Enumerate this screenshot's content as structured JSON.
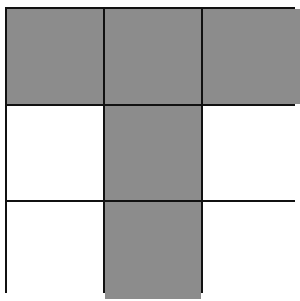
{
  "diagram": {
    "type": "grid",
    "rows": 3,
    "columns": 3,
    "fill_color": "#8c8c8c",
    "empty_color": "#ffffff",
    "line_color": "#111111",
    "cells": [
      [
        true,
        true,
        true
      ],
      [
        false,
        true,
        false
      ],
      [
        false,
        true,
        false
      ]
    ]
  }
}
